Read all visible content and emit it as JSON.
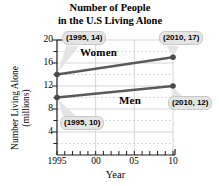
{
  "title": {
    "line1": "Number of People",
    "line2": "in the U.S Living Alone"
  },
  "chart_data": {
    "type": "line",
    "x": [
      1995,
      2010
    ],
    "series": [
      {
        "name": "Women",
        "values": [
          14,
          17
        ]
      },
      {
        "name": "Men",
        "values": [
          10,
          12
        ]
      }
    ],
    "title": "Number of People in the U.S Living Alone",
    "xlabel": "Year",
    "ylabel": "Number Living Alone (millions)",
    "ylabel_lines": {
      "line1": "Number Living Alone",
      "line2": "(millions)"
    },
    "xlim": [
      1995,
      2010
    ],
    "ylim": [
      0,
      20
    ],
    "x_tick_labels": [
      "1995",
      "00",
      "05",
      "10"
    ],
    "y_tick_labels": [
      "20",
      "16",
      "12",
      "8",
      "4"
    ],
    "x_major_ticks": [
      1995,
      2000,
      2005,
      2010
    ],
    "y_major_ticks": [
      20,
      16,
      12,
      8,
      4
    ],
    "minor_tick_step_y": 2,
    "minor_tick_step_x": 1,
    "grid": true,
    "legend_position": "inline-labels",
    "annotations": [
      {
        "text": "(1995, 14)",
        "series": "Women",
        "x": 1995,
        "y": 14
      },
      {
        "text": "(2010, 17)",
        "series": "Women",
        "x": 2010,
        "y": 17
      },
      {
        "text": "(1995, 10)",
        "series": "Men",
        "x": 1995,
        "y": 10
      },
      {
        "text": "(2010, 12)",
        "series": "Men",
        "x": 2010,
        "y": 12
      }
    ],
    "colors": {
      "line": "#5a5a5a",
      "marker": "#4a4a4a",
      "grid": "#d5d5d5",
      "axis": "#1a1a1a",
      "callout_bg": "#e4e4e4",
      "callout_border": "#c9c9c9"
    }
  }
}
